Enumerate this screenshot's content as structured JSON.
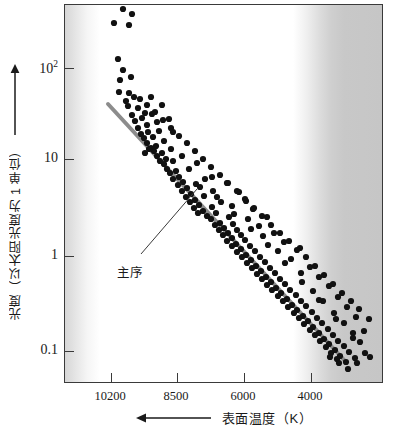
{
  "chart_data": {
    "type": "scatter",
    "title": "",
    "xlabel": "表面温度（K）",
    "ylabel": "光度（以太阳光度为 1 单位）",
    "x_arrow_direction": "left",
    "y_arrow_direction": "up",
    "grid": false,
    "legend": false,
    "x_axis": {
      "name": "surface-temperature",
      "unit": "K",
      "scale": "reversed-linear",
      "tick_labels": [
        "10200",
        "8500",
        "6000",
        "4000"
      ],
      "tick_values": [
        10200,
        8500,
        6000,
        4000
      ],
      "tick_pixel_x": [
        110,
        176,
        243,
        310
      ],
      "direction_note": "temperature decreases to the right"
    },
    "y_axis": {
      "name": "luminosity",
      "unit": "solar luminosity = 1",
      "scale": "log10",
      "tick_labels": [
        "10²",
        "10",
        "1",
        "0.1"
      ],
      "tick_values": [
        100,
        10,
        1,
        0.1
      ],
      "tick_pixel_y": [
        67,
        158,
        255,
        350
      ],
      "ylim": [
        0.05,
        500
      ]
    },
    "annotations": [
      {
        "label": "主序",
        "meaning": "main-sequence",
        "text_x": 117,
        "text_y": 262,
        "leader_from_x": 140,
        "leader_from_y": 253,
        "leader_to_x": 196,
        "leader_to_y": 188
      }
    ],
    "main_sequence_band": {
      "color": "#8c8c8c",
      "x1": 107,
      "y1": 103,
      "x2": 345,
      "y2": 361,
      "width_px": 4
    },
    "background_bands": {
      "left_gray": "#d6d6d6",
      "center_white": "#ffffff",
      "right_gray": "#c6c6c6",
      "note": "horizontal gradient: gray at both extremes of temperature, white in middle"
    },
    "point_style": {
      "color": "#111111",
      "radius": 3.1,
      "shape": "circle"
    },
    "points": [
      [
        122,
        8
      ],
      [
        131,
        13
      ],
      [
        113,
        22
      ],
      [
        128,
        24
      ],
      [
        117,
        58
      ],
      [
        122,
        69
      ],
      [
        119,
        79
      ],
      [
        130,
        76
      ],
      [
        118,
        91
      ],
      [
        128,
        92
      ],
      [
        133,
        96
      ],
      [
        125,
        100
      ],
      [
        139,
        98
      ],
      [
        150,
        96
      ],
      [
        161,
        104
      ],
      [
        127,
        105
      ],
      [
        137,
        107
      ],
      [
        144,
        112
      ],
      [
        131,
        114
      ],
      [
        141,
        117
      ],
      [
        151,
        113
      ],
      [
        156,
        121
      ],
      [
        134,
        120
      ],
      [
        146,
        124
      ],
      [
        158,
        130
      ],
      [
        168,
        118
      ],
      [
        137,
        127
      ],
      [
        147,
        131
      ],
      [
        140,
        133
      ],
      [
        143,
        137
      ],
      [
        152,
        136
      ],
      [
        163,
        140
      ],
      [
        172,
        131
      ],
      [
        146,
        142
      ],
      [
        155,
        145
      ],
      [
        150,
        147
      ],
      [
        153,
        150
      ],
      [
        161,
        152
      ],
      [
        170,
        148
      ],
      [
        156,
        155
      ],
      [
        165,
        158
      ],
      [
        159,
        160
      ],
      [
        148,
        148
      ],
      [
        144,
        152
      ],
      [
        163,
        163
      ],
      [
        172,
        160
      ],
      [
        181,
        155
      ],
      [
        166,
        168
      ],
      [
        175,
        170
      ],
      [
        169,
        172
      ],
      [
        178,
        176
      ],
      [
        188,
        168
      ],
      [
        196,
        162
      ],
      [
        172,
        178
      ],
      [
        182,
        181
      ],
      [
        177,
        184
      ],
      [
        186,
        187
      ],
      [
        195,
        183
      ],
      [
        204,
        178
      ],
      [
        181,
        190
      ],
      [
        190,
        193
      ],
      [
        185,
        196
      ],
      [
        194,
        199
      ],
      [
        203,
        195
      ],
      [
        212,
        190
      ],
      [
        189,
        201
      ],
      [
        198,
        204
      ],
      [
        193,
        207
      ],
      [
        202,
        210
      ],
      [
        211,
        206
      ],
      [
        220,
        201
      ],
      [
        197,
        212
      ],
      [
        206,
        215
      ],
      [
        215,
        212
      ],
      [
        210,
        218
      ],
      [
        219,
        222
      ],
      [
        228,
        216
      ],
      [
        214,
        224
      ],
      [
        223,
        227
      ],
      [
        232,
        223
      ],
      [
        218,
        229
      ],
      [
        227,
        232
      ],
      [
        236,
        229
      ],
      [
        222,
        234
      ],
      [
        231,
        237
      ],
      [
        240,
        234
      ],
      [
        226,
        240
      ],
      [
        235,
        243
      ],
      [
        244,
        239
      ],
      [
        231,
        245
      ],
      [
        240,
        248
      ],
      [
        249,
        245
      ],
      [
        236,
        251
      ],
      [
        245,
        254
      ],
      [
        254,
        250
      ],
      [
        241,
        256
      ],
      [
        250,
        259
      ],
      [
        259,
        256
      ],
      [
        246,
        262
      ],
      [
        255,
        265
      ],
      [
        264,
        261
      ],
      [
        251,
        267
      ],
      [
        260,
        270
      ],
      [
        269,
        267
      ],
      [
        256,
        273
      ],
      [
        265,
        276
      ],
      [
        274,
        272
      ],
      [
        261,
        278
      ],
      [
        270,
        281
      ],
      [
        279,
        278
      ],
      [
        266,
        284
      ],
      [
        275,
        287
      ],
      [
        284,
        283
      ],
      [
        271,
        289
      ],
      [
        280,
        292
      ],
      [
        289,
        289
      ],
      [
        277,
        295
      ],
      [
        286,
        298
      ],
      [
        295,
        294
      ],
      [
        282,
        300
      ],
      [
        291,
        304
      ],
      [
        300,
        300
      ],
      [
        287,
        306
      ],
      [
        296,
        309
      ],
      [
        305,
        305
      ],
      [
        293,
        312
      ],
      [
        302,
        315
      ],
      [
        311,
        311
      ],
      [
        298,
        317
      ],
      [
        307,
        320
      ],
      [
        316,
        317
      ],
      [
        303,
        323
      ],
      [
        312,
        326
      ],
      [
        321,
        322
      ],
      [
        309,
        329
      ],
      [
        318,
        332
      ],
      [
        327,
        328
      ],
      [
        314,
        334
      ],
      [
        323,
        338
      ],
      [
        332,
        334
      ],
      [
        319,
        340
      ],
      [
        328,
        343
      ],
      [
        337,
        340
      ],
      [
        325,
        346
      ],
      [
        334,
        349
      ],
      [
        343,
        345
      ],
      [
        330,
        352
      ],
      [
        339,
        355
      ],
      [
        348,
        351
      ],
      [
        336,
        358
      ],
      [
        345,
        361
      ],
      [
        354,
        357
      ],
      [
        211,
        176
      ],
      [
        226,
        182
      ],
      [
        238,
        191
      ],
      [
        245,
        200
      ],
      [
        231,
        205
      ],
      [
        252,
        208
      ],
      [
        266,
        216
      ],
      [
        258,
        225
      ],
      [
        273,
        232
      ],
      [
        283,
        241
      ],
      [
        247,
        218
      ],
      [
        262,
        235
      ],
      [
        277,
        250
      ],
      [
        290,
        258
      ],
      [
        299,
        247
      ],
      [
        309,
        266
      ],
      [
        318,
        276
      ],
      [
        328,
        285
      ],
      [
        337,
        296
      ],
      [
        346,
        306
      ],
      [
        355,
        316
      ],
      [
        300,
        272
      ],
      [
        312,
        290
      ],
      [
        322,
        300
      ],
      [
        333,
        312
      ],
      [
        343,
        322
      ],
      [
        352,
        332
      ],
      [
        359,
        341
      ],
      [
        364,
        352
      ],
      [
        356,
        362
      ],
      [
        347,
        368
      ],
      [
        338,
        362
      ],
      [
        329,
        356
      ],
      [
        363,
        330
      ],
      [
        368,
        318
      ],
      [
        358,
        308
      ],
      [
        350,
        300
      ],
      [
        341,
        292
      ],
      [
        332,
        283
      ],
      [
        323,
        274
      ],
      [
        314,
        265
      ],
      [
        305,
        256
      ],
      [
        296,
        249
      ],
      [
        288,
        240
      ],
      [
        279,
        232
      ],
      [
        270,
        224
      ],
      [
        261,
        215
      ],
      [
        253,
        207
      ],
      [
        244,
        198
      ],
      [
        236,
        190
      ],
      [
        227,
        182
      ],
      [
        219,
        174
      ],
      [
        210,
        166
      ],
      [
        202,
        158
      ],
      [
        194,
        150
      ],
      [
        186,
        142
      ],
      [
        178,
        135
      ],
      [
        170,
        127
      ],
      [
        162,
        119
      ],
      [
        154,
        111
      ],
      [
        146,
        104
      ],
      [
        139,
        98
      ],
      [
        199,
        186
      ],
      [
        216,
        196
      ],
      [
        233,
        213
      ],
      [
        250,
        228
      ],
      [
        267,
        244
      ],
      [
        284,
        262
      ],
      [
        301,
        281
      ],
      [
        318,
        299
      ],
      [
        335,
        318
      ],
      [
        352,
        337
      ],
      [
        369,
        356
      ]
    ],
    "extra_points_upper_left": [
      [
        122,
        8
      ],
      [
        131,
        13
      ],
      [
        113,
        22
      ],
      [
        128,
        24
      ]
    ]
  },
  "axis_labels": {
    "y_tick_100": "10",
    "y_tick_100_exp": "2",
    "y_tick_10": "10",
    "y_tick_1": "1",
    "y_tick_01": "0.1",
    "x_tick_1": "10200",
    "x_tick_2": "8500",
    "x_tick_3": "6000",
    "x_tick_4": "4000"
  },
  "titles": {
    "y_axis_title": "光度（以太阳光度为 1 单位）",
    "x_axis_title": "表面温度（K）"
  },
  "annotation": {
    "main_sequence_label": "主序"
  }
}
